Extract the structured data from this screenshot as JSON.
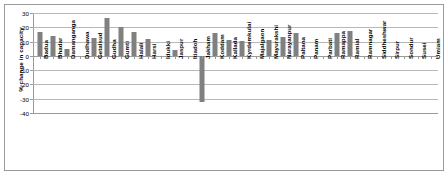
{
  "chart_data": {
    "type": "bar",
    "title": "",
    "xlabel": "",
    "ylabel": "% change in capacity",
    "ylim": [
      -40,
      30
    ],
    "yticks": [
      30,
      20,
      10,
      0,
      -10,
      -20,
      -30,
      -40
    ],
    "ytick_labels": [
      "30",
      "20",
      "10",
      "0",
      "-10",
      "-20",
      "-30",
      "-40"
    ],
    "grid": true,
    "legend": "none",
    "bar_color": "#808080",
    "categories": [
      "Badua",
      "Bhadar",
      "Damanganga",
      "Dudhawa",
      "Getalsud",
      "Gudha",
      "Gumti",
      "Halali",
      "Harsi",
      "Idukki",
      "Jaspur",
      "Itiadoh",
      "Jakham",
      "Koddam",
      "Kallada",
      "Kyrdemkulai",
      "Majalgaon",
      "Mayurakshi",
      "Narayanpur",
      "Paltana",
      "Panam",
      "Parbati",
      "Ramappa",
      "Ramial",
      "Ramnagar",
      "Siddheshwar",
      "Sirpur",
      "Sondur",
      "Susei",
      "Umiam"
    ],
    "values": [
      16.5,
      14.0,
      5.0,
      0.0,
      12.5,
      26.5,
      20.0,
      17.0,
      11.5,
      0.0,
      4.0,
      0.0,
      -32.0,
      16.0,
      11.0,
      10.5,
      0.0,
      11.0,
      13.0,
      16.0,
      0.0,
      0.0,
      16.0,
      17.5,
      0.0,
      0.0,
      0.0,
      0.0,
      0.0,
      0.0
    ]
  }
}
